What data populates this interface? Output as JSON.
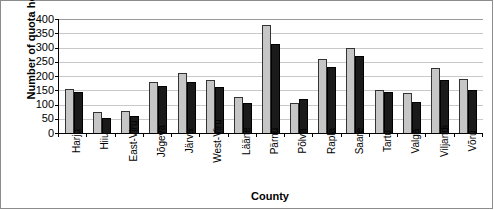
{
  "chart_data": {
    "type": "bar",
    "title": "",
    "xlabel": "County",
    "ylabel": "Number of quota holders",
    "ylim": [
      0,
      400
    ],
    "ytick_step": 50,
    "yticks": [
      "400",
      "350",
      "300",
      "250",
      "200",
      "150",
      "100",
      "50",
      "0"
    ],
    "grid": true,
    "legend": null,
    "categories": [
      "Harju",
      "Hiiu",
      "East-Viru",
      "Jõgeva",
      "Järva",
      "West-Viru",
      "Lääne",
      "Pärnu",
      "Põlva",
      "Rapla",
      "Saare",
      "Tartu",
      "Valga",
      "Viljandi",
      "Võru"
    ],
    "series": [
      {
        "name": "series-1",
        "color": "#c6c6c6",
        "values": [
          155,
          73,
          78,
          180,
          210,
          186,
          128,
          378,
          105,
          258,
          297,
          152,
          140,
          228,
          188
        ]
      },
      {
        "name": "series-2",
        "color": "#1a1a1a",
        "values": [
          145,
          51,
          60,
          165,
          178,
          160,
          105,
          312,
          118,
          232,
          270,
          145,
          110,
          185,
          152
        ]
      }
    ]
  }
}
